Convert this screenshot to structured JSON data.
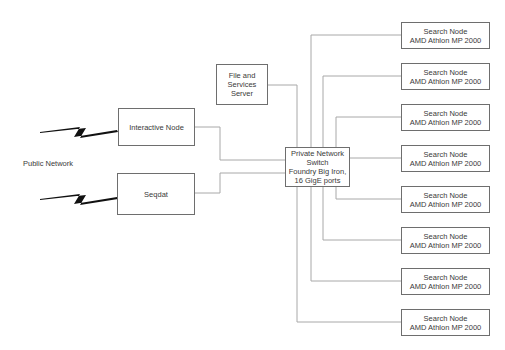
{
  "diagram": {
    "public_network": {
      "label": "Public Network"
    },
    "interactive_node": {
      "label": "Interactive Node"
    },
    "seqdat": {
      "label": "Seqdat"
    },
    "file_server": {
      "label": "File and\nServices\nServer"
    },
    "switch": {
      "label": "Private Network\nSwitch\nFoundry Big Iron,\n16 GigE ports"
    },
    "search_nodes": [
      {
        "label": "Search Node\nAMD Athlon MP 2000"
      },
      {
        "label": "Search Node\nAMD Athlon MP 2000"
      },
      {
        "label": "Search Node\nAMD Athlon MP 2000"
      },
      {
        "label": "Search Node\nAMD Athlon MP 2000"
      },
      {
        "label": "Search Node\nAMD Athlon MP 2000"
      },
      {
        "label": "Search Node\nAMD Athlon MP 2000"
      },
      {
        "label": "Search Node\nAMD Athlon MP 2000"
      },
      {
        "label": "Search Node\nAMD Athlon MP 2000"
      }
    ],
    "colors": {
      "line": "#a8a8a8",
      "border": "#6e6e6e",
      "text": "#3a3a3a",
      "bolt": "#111111"
    }
  }
}
